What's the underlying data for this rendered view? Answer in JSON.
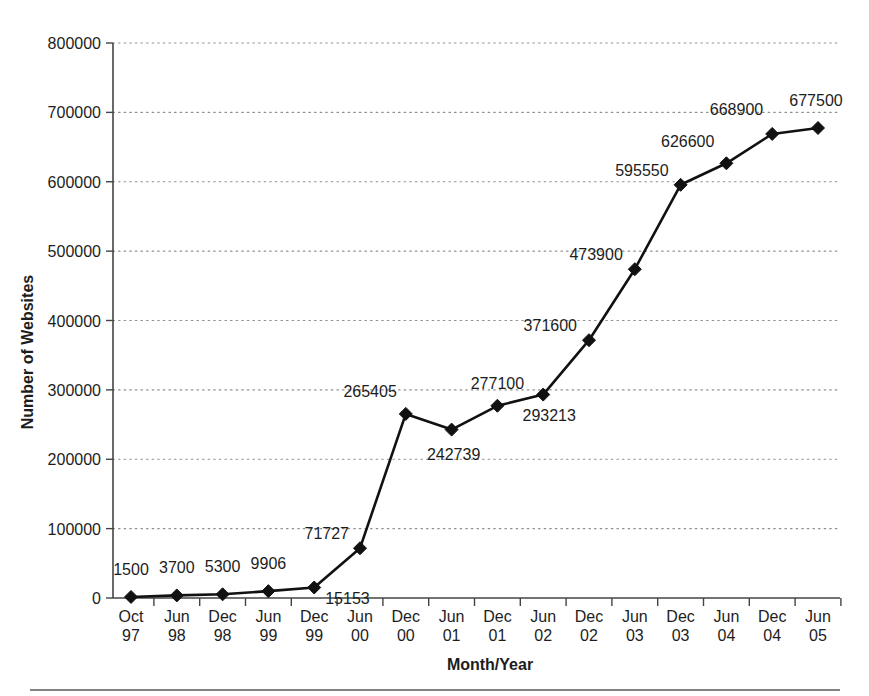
{
  "chart_data": {
    "type": "line",
    "title": "",
    "subtitle": "",
    "xlabel": "Month/Year",
    "ylabel": "Number of Websites",
    "ylim": [
      0,
      800000
    ],
    "xlim_categories": 16,
    "grid": "horizontal-dotted",
    "legend": "none",
    "marker": "diamond",
    "line_color": "#111111",
    "marker_color": "#111111",
    "grid_color": "#8d8d8d",
    "axis_color": "#444444",
    "background": "#ffffff",
    "categories": [
      "Oct 97",
      "Jun 98",
      "Dec 98",
      "Jun 99",
      "Dec 99",
      "Jun 00",
      "Dec 00",
      "Jun 01",
      "Dec 01",
      "Jun 02",
      "Dec 02",
      "Jun 03",
      "Dec 03",
      "Jun 04",
      "Dec 04",
      "Jun 05"
    ],
    "categories_month": [
      "Oct",
      "Jun",
      "Dec",
      "Jun",
      "Dec",
      "Jun",
      "Dec",
      "Jun",
      "Dec",
      "Jun",
      "Dec",
      "Jun",
      "Dec",
      "Jun",
      "Dec",
      "Jun"
    ],
    "categories_year": [
      "97",
      "98",
      "98",
      "99",
      "99",
      "00",
      "00",
      "01",
      "01",
      "02",
      "02",
      "03",
      "03",
      "04",
      "04",
      "05"
    ],
    "values": [
      1500,
      3700,
      5300,
      9906,
      15153,
      71727,
      265405,
      242739,
      277100,
      293213,
      371600,
      473900,
      595550,
      626600,
      668900,
      677500
    ],
    "value_labels": [
      "1500",
      "3700",
      "5300",
      "9906",
      "15153",
      "71727",
      "265405",
      "242739",
      "277100",
      "293213",
      "371600",
      "473900",
      "595550",
      "626600",
      "668900",
      "677500"
    ],
    "yticks": [
      0,
      100000,
      200000,
      300000,
      400000,
      500000,
      600000,
      700000,
      800000
    ],
    "ytick_labels": [
      "0",
      "100000",
      "200000",
      "300000",
      "400000",
      "500000",
      "600000",
      "700000",
      "800000"
    ]
  },
  "footer": {
    "rule": "horizontal-separator"
  }
}
